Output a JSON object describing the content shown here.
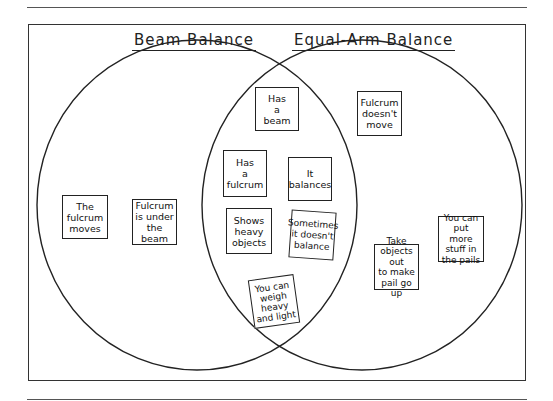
{
  "diagram": {
    "type": "venn",
    "sets": [
      {
        "id": "left",
        "label": "Beam Balance"
      },
      {
        "id": "right",
        "label": "Equal-Arm Balance"
      }
    ],
    "items": {
      "left_only": [
        "The\nfulcrum\nmoves",
        "Fulcrum\nis under\nthe beam"
      ],
      "both": [
        "Has\na\nbeam",
        "Has\na\nfulcrum",
        "It\nbalances",
        "Shows\nheavy\nobjects",
        "Sometimes\nit doesn't\nbalance",
        "You can\nweigh\nheavy\nand light"
      ],
      "right_only": [
        "Fulcrum\ndoesn't\nmove",
        "Take\nobjects out\nto make\npail go up",
        "You can\nput more\nstuff in\nthe pails"
      ]
    },
    "colors": {
      "stroke": "#222222",
      "background": "#ffffff"
    }
  }
}
